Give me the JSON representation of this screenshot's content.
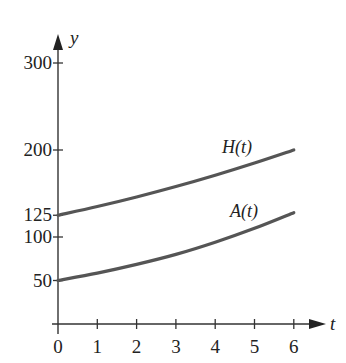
{
  "chart_data": {
    "type": "line",
    "title": "",
    "xlabel": "t",
    "ylabel": "y",
    "x": [
      0,
      1,
      2,
      3,
      4,
      5,
      6
    ],
    "xticks": [
      "0",
      "1",
      "2",
      "3",
      "4",
      "5",
      "6"
    ],
    "yticks": [
      "50",
      "100",
      "125",
      "200",
      "300"
    ],
    "ytick_values": [
      50,
      100,
      125,
      200,
      300
    ],
    "xlim": [
      0,
      6.5
    ],
    "ylim": [
      0,
      330
    ],
    "grid": false,
    "legend": "inline labels",
    "series": [
      {
        "name": "H(t)",
        "values": [
          125,
          135,
          146,
          158,
          171,
          185,
          200
        ]
      },
      {
        "name": "A(t)",
        "values": [
          50,
          58.5,
          68.5,
          80,
          94,
          110,
          128
        ]
      }
    ]
  },
  "layout": {
    "origin_px": [
      58,
      324
    ],
    "x_unit_px": 39.3,
    "y_unit_px": 0.87
  }
}
